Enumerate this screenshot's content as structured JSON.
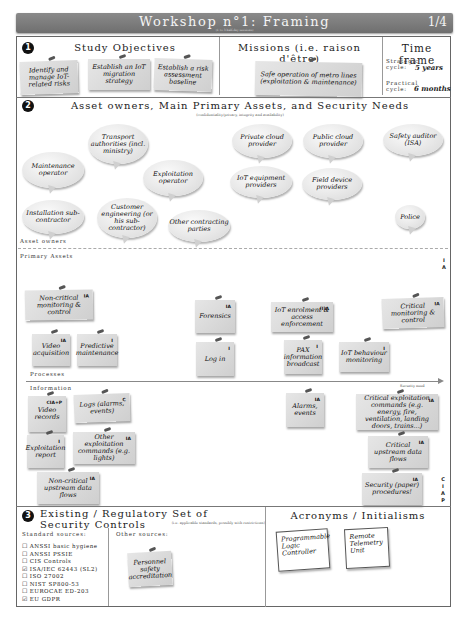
{
  "header": {
    "title": "Workshop n°1: Framing",
    "subtitle": "(1 to 3 half-day sessions)",
    "page": "1/4"
  },
  "section1": {
    "number": "1",
    "objectives_title": "Study Objectives",
    "objectives": [
      "Identify and manage IoT-related risks",
      "Establish an IoT migration strategy",
      "Establish a risk assessment baseline"
    ],
    "missions_title": "Missions (i.e. raison d'être)",
    "missions": [
      "Safe operation of metro lines (exploitation & maintenance)"
    ],
    "timeframe_title": "Time frame",
    "timeframe": [
      {
        "label": "Strategic cycle:",
        "value": "5 years"
      },
      {
        "label": "Practical cycle:",
        "value": "6 months"
      }
    ]
  },
  "section2": {
    "number": "2",
    "title": "Asset owners, Main Primary Assets, and Security Needs",
    "subtitle": "(confidentiality/privacy, integrity and availability)",
    "owners_label": "Asset owners",
    "owners": [
      "Transport authorities (incl. ministry)",
      "Maintenance operator",
      "Exploitation operator",
      "Installation sub-contractor",
      "Customer engineering (or his sub-contractor)",
      "Other contracting parties",
      "Private cloud provider",
      "Public cloud provider",
      "IoT equipment providers",
      "Field device providers",
      "Safety auditor (ISA)",
      "Police"
    ],
    "primary_assets_label": "Primary Assets",
    "processes_label": "Processes",
    "processes": [
      {
        "text": "Non-critical monitoring & control",
        "need": "IA"
      },
      {
        "text": "Video acquisition",
        "need": "IA"
      },
      {
        "text": "Predictive maintenance",
        "need": "I"
      },
      {
        "text": "Forensics",
        "need": "IA"
      },
      {
        "text": "Log in",
        "need": "I"
      },
      {
        "text": "IoT enrolment & access enforcement",
        "need": "(I)A"
      },
      {
        "text": "PAX information broadcast",
        "need": "I"
      },
      {
        "text": "IoT behaviour monitoring",
        "need": "I"
      },
      {
        "text": "Critical monitoring & control",
        "need": "IA"
      }
    ],
    "information_label": "Information",
    "information": [
      {
        "text": "Video records",
        "need": "CIA+P"
      },
      {
        "text": "Logs (alarms, events)",
        "need": "C"
      },
      {
        "text": "Exploitation report",
        "need": "I"
      },
      {
        "text": "Other exploitation commands (e.g. lights)",
        "need": "IA"
      },
      {
        "text": "Non-critical upstream data flows",
        "need": "IA"
      },
      {
        "text": "Alarms, events",
        "need": "IA"
      },
      {
        "text": "Critical exploitation commands (e.g. energy, fire, ventilation, landing doors, trains...)",
        "need": "IA"
      },
      {
        "text": "Critical upstream data flows",
        "need": "IA"
      },
      {
        "text": "Security (paper) procedures!",
        "need": "IA"
      }
    ],
    "axis_label": "Security need",
    "axis_top": [
      "I",
      "A"
    ],
    "axis_bottom": [
      "C",
      "I",
      "A",
      "P"
    ]
  },
  "section3": {
    "number": "3",
    "title": "Existing / Regulatory Set of Security Controls",
    "subtitle": "(i.e. applicable standards, possibly with restrictions)",
    "standard_label": "Standard sources:",
    "standards": [
      {
        "name": "ANSSI basic hygiene",
        "checked": false
      },
      {
        "name": "ANSSI PSSIE",
        "checked": false
      },
      {
        "name": "CIS Controls",
        "checked": false
      },
      {
        "name": "ISA/IEC 62443 (SL2)",
        "checked": true
      },
      {
        "name": "ISO 27002",
        "checked": false
      },
      {
        "name": "NIST SP800-53",
        "checked": false
      },
      {
        "name": "EUROCAE ED-203",
        "checked": false
      },
      {
        "name": "EU GDPR",
        "checked": true
      }
    ],
    "other_label": "Other sources:",
    "other": [
      "Personnel safety accreditation"
    ]
  },
  "acronyms": {
    "title": "Acronyms / Initialisms",
    "items": [
      "Programmable Logic Controller",
      "Remote Telemetry Unit"
    ]
  }
}
